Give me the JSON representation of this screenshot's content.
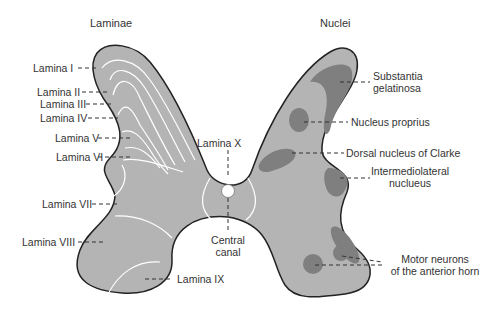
{
  "headers": {
    "left": "Laminae",
    "right": "Nuclei"
  },
  "laminae": [
    {
      "label": "Lamina I"
    },
    {
      "label": "Lamina II"
    },
    {
      "label": "Lamina III"
    },
    {
      "label": "Lamina IV"
    },
    {
      "label": "Lamina V"
    },
    {
      "label": "Lamina VI"
    },
    {
      "label": "Lamina VII"
    },
    {
      "label": "Lamina VIII"
    },
    {
      "label": "Lamina IX"
    },
    {
      "label": "Lamina X"
    }
  ],
  "center": {
    "canal_line1": "Central",
    "canal_line2": "canal"
  },
  "nuclei": {
    "substantia_line1": "Substantia",
    "substantia_line2": "gelatinosa",
    "proprius": "Nucleus proprius",
    "clarke": "Dorsal nucleus of Clarke",
    "iml_line1": "Intermediolateral",
    "iml_line2": "nuclueus",
    "motor_line1": "Motor neurons",
    "motor_line2": "of the anterior horn"
  },
  "colors": {
    "gray_matter": "#b4b4b4",
    "nucleus": "#7f7f7f",
    "outline": "#222222",
    "lines": "#ffffff"
  }
}
